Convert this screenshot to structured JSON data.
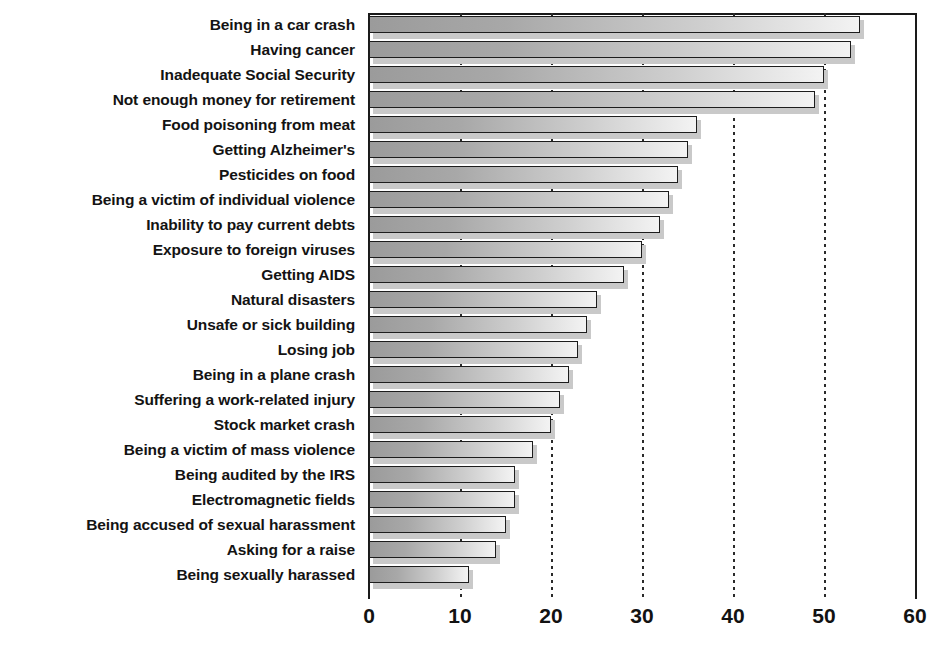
{
  "chart_data": {
    "type": "bar",
    "orientation": "horizontal",
    "title": "",
    "xlabel": "",
    "ylabel": "",
    "xlim": [
      0,
      60
    ],
    "xticks": [
      0,
      10,
      20,
      30,
      40,
      50,
      60
    ],
    "grid": "vertical-dotted",
    "legend": "none",
    "categories": [
      "Being in a car crash",
      "Having cancer",
      "Inadequate Social Security",
      "Not enough money for retirement",
      "Food poisoning from meat",
      "Getting Alzheimer's",
      "Pesticides on food",
      "Being a victim of individual violence",
      "Inability to pay current debts",
      "Exposure to foreign viruses",
      "Getting AIDS",
      "Natural disasters",
      "Unsafe or sick building",
      "Losing job",
      "Being in a plane crash",
      "Suffering a work-related injury",
      "Stock market crash",
      "Being a victim of mass violence",
      "Being audited by the IRS",
      "Electromagnetic fields",
      "Being accused of sexual harassment",
      "Asking for a raise",
      "Being sexually harassed"
    ],
    "values": [
      54,
      53,
      50,
      49,
      36,
      35,
      34,
      33,
      32,
      30,
      28,
      25,
      24,
      23,
      22,
      21,
      20,
      18,
      16,
      16,
      15,
      14,
      11
    ],
    "bar_fill_start_color": "#9b9b9b",
    "bar_fill_end_color": "#f3f3f3",
    "bar_outline_color": "#1d1d1d",
    "axis_color": "#1a1a1a",
    "text_color": "#131313"
  }
}
